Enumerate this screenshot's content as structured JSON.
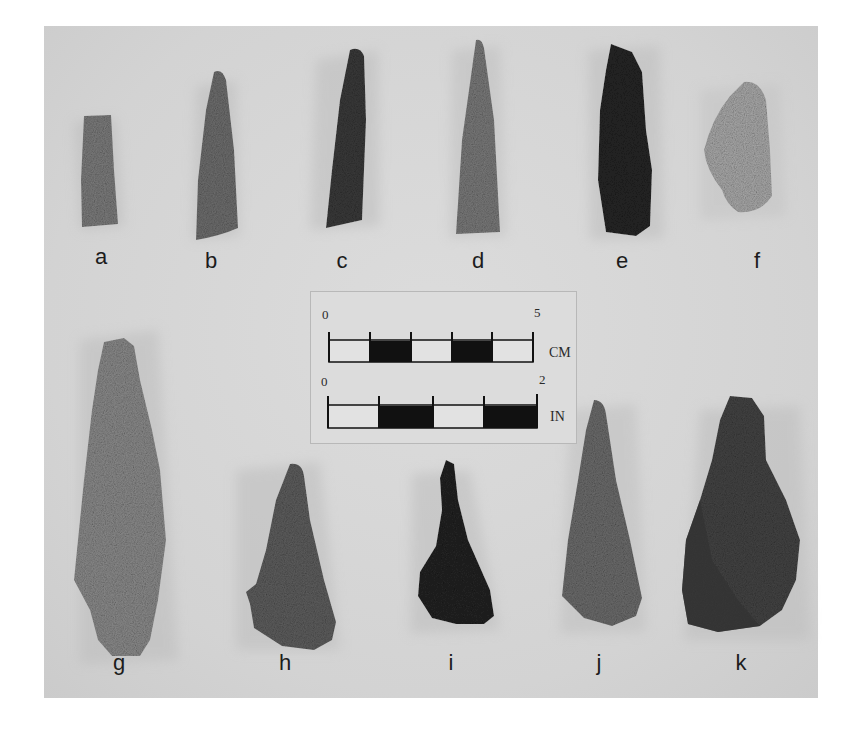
{
  "figure": {
    "background_color": "#d6d6d6",
    "artifacts": [
      {
        "label": "a",
        "tone": "#7c7c7c"
      },
      {
        "label": "b",
        "tone": "#6e6e6e"
      },
      {
        "label": "c",
        "tone": "#3a3a3a"
      },
      {
        "label": "d",
        "tone": "#7a7a7a"
      },
      {
        "label": "e",
        "tone": "#262626"
      },
      {
        "label": "f",
        "tone": "#a9a9a9"
      },
      {
        "label": "g",
        "tone": "#8a8a8a"
      },
      {
        "label": "h",
        "tone": "#5e5e5e"
      },
      {
        "label": "i",
        "tone": "#232323"
      },
      {
        "label": "j",
        "tone": "#6c6c6c"
      },
      {
        "label": "k",
        "tone": "#444444"
      }
    ],
    "scale_bar": {
      "metric": {
        "start": "0",
        "end": "5",
        "unit": "CM",
        "segments": 5
      },
      "imperial": {
        "start": "0",
        "end": "2",
        "unit": "IN",
        "segments": 4
      }
    }
  }
}
